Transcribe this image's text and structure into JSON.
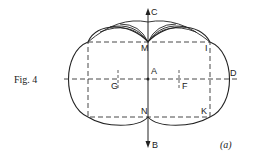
{
  "figure": {
    "title": "Fig. 4",
    "caption": "(a)",
    "labels": {
      "C": "C",
      "M": "M",
      "I": "I",
      "A": "A",
      "D": "D",
      "G": "G",
      "F": "F",
      "N": "N",
      "K": "K",
      "B": "B"
    }
  }
}
